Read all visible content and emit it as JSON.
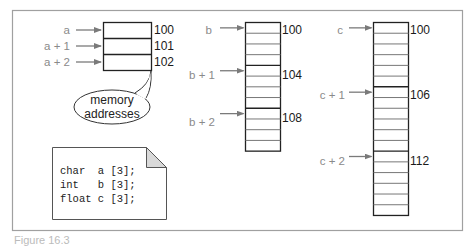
{
  "figure": {
    "frame_color": "#999999",
    "arrow_color": "#7a7a7a",
    "label_color": "#8a8a8a",
    "caption": "Figure 16.3"
  },
  "arrays": [
    {
      "name": "a",
      "type": "char",
      "cells": 3,
      "bytes_per_element": 1,
      "pointers": [
        {
          "label": "a",
          "address": "100"
        },
        {
          "label": "a + 1",
          "address": "101"
        },
        {
          "label": "a + 2",
          "address": "102"
        }
      ]
    },
    {
      "name": "b",
      "type": "int",
      "cells": 12,
      "bytes_per_element": 4,
      "pointers": [
        {
          "label": "b",
          "address": "100"
        },
        {
          "label": "b + 1",
          "address": "104"
        },
        {
          "label": "b + 2",
          "address": "108"
        }
      ]
    },
    {
      "name": "c",
      "type": "float",
      "cells": 18,
      "bytes_per_element": 6,
      "pointers": [
        {
          "label": "c",
          "address": "100"
        },
        {
          "label": "c + 1",
          "address": "106"
        },
        {
          "label": "c + 2",
          "address": "112"
        }
      ]
    }
  ],
  "callout": {
    "line1": "memory",
    "line2": "addresses"
  },
  "code_note": {
    "lines": [
      "char  a [3];",
      "int   b [3];",
      "float c [3];"
    ]
  }
}
